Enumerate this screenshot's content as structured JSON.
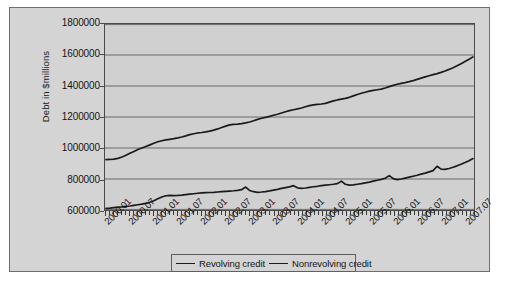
{
  "chart_data": {
    "type": "line",
    "title": "",
    "xlabel": "",
    "ylabel": "Debt in $millions",
    "ylim": [
      600000,
      1800000
    ],
    "ytick_step": 200000,
    "ytick_labels": [
      "1800000",
      "1600000",
      "1400000",
      "1200000",
      "1000000",
      "800000",
      "600000"
    ],
    "ytick_values": [
      1800000,
      1600000,
      1400000,
      1200000,
      1000000,
      800000,
      600000
    ],
    "grid": "horizontal",
    "legend_position": "bottom",
    "x_tick_labels": [
      "2000.01",
      "2000.07",
      "2001.01",
      "2001.07",
      "2002.01",
      "2002.07",
      "2003.01",
      "2003.07",
      "2004.01",
      "2004.07",
      "2005.01",
      "2005.07",
      "2006.01",
      "2006.07",
      "2007.01",
      "2007.07"
    ],
    "x_minor_tick_interval_months": 1,
    "x_range": [
      "2000.01",
      "2007.09"
    ],
    "x_months": [
      "2000.01",
      "2000.02",
      "2000.03",
      "2000.04",
      "2000.05",
      "2000.06",
      "2000.07",
      "2000.08",
      "2000.09",
      "2000.10",
      "2000.11",
      "2000.12",
      "2001.01",
      "2001.02",
      "2001.03",
      "2001.04",
      "2001.05",
      "2001.06",
      "2001.07",
      "2001.08",
      "2001.09",
      "2001.10",
      "2001.11",
      "2001.12",
      "2002.01",
      "2002.02",
      "2002.03",
      "2002.04",
      "2002.05",
      "2002.06",
      "2002.07",
      "2002.08",
      "2002.09",
      "2002.10",
      "2002.11",
      "2002.12",
      "2003.01",
      "2003.02",
      "2003.03",
      "2003.04",
      "2003.05",
      "2003.06",
      "2003.07",
      "2003.08",
      "2003.09",
      "2003.10",
      "2003.11",
      "2003.12",
      "2004.01",
      "2004.02",
      "2004.03",
      "2004.04",
      "2004.05",
      "2004.06",
      "2004.07",
      "2004.08",
      "2004.09",
      "2004.10",
      "2004.11",
      "2004.12",
      "2005.01",
      "2005.02",
      "2005.03",
      "2005.04",
      "2005.05",
      "2005.06",
      "2005.07",
      "2005.08",
      "2005.09",
      "2005.10",
      "2005.11",
      "2005.12",
      "2006.01",
      "2006.02",
      "2006.03",
      "2006.04",
      "2006.05",
      "2006.06",
      "2006.07",
      "2006.08",
      "2006.09",
      "2006.10",
      "2006.11",
      "2006.12",
      "2007.01",
      "2007.02",
      "2007.03",
      "2007.04",
      "2007.05",
      "2007.06",
      "2007.07",
      "2007.08",
      "2007.09"
    ],
    "series": [
      {
        "name": "Revolving credit",
        "color": "#1a1a1a",
        "values": [
          610000,
          612000,
          615000,
          618000,
          620000,
          623000,
          626000,
          630000,
          634000,
          638000,
          643000,
          650000,
          660000,
          672000,
          684000,
          692000,
          694000,
          693000,
          694000,
          696000,
          699000,
          702000,
          705000,
          708000,
          710000,
          712000,
          713000,
          714000,
          716000,
          718000,
          720000,
          722000,
          724000,
          727000,
          731000,
          748000,
          726000,
          718000,
          714000,
          716000,
          719000,
          723000,
          728000,
          733000,
          739000,
          744000,
          749000,
          757000,
          743000,
          740000,
          742000,
          746000,
          750000,
          753000,
          757000,
          760000,
          763000,
          766000,
          770000,
          786000,
          766000,
          760000,
          762000,
          766000,
          770000,
          775000,
          780000,
          786000,
          792000,
          798000,
          805000,
          822000,
          802000,
          796000,
          800000,
          806000,
          812000,
          818000,
          824000,
          831000,
          838000,
          846000,
          854000,
          882000,
          864000,
          862000,
          868000,
          876000,
          885000,
          895000,
          906000,
          918000,
          932000
        ]
      },
      {
        "name": "Nonrevolving credit",
        "color": "#1a1a1a",
        "values": [
          925000,
          926000,
          928000,
          933000,
          942000,
          953000,
          966000,
          978000,
          990000,
          1000000,
          1010000,
          1020000,
          1031000,
          1040000,
          1047000,
          1052000,
          1056000,
          1060000,
          1065000,
          1071000,
          1078000,
          1086000,
          1092000,
          1097000,
          1100000,
          1104000,
          1109000,
          1115000,
          1123000,
          1132000,
          1141000,
          1149000,
          1152000,
          1154000,
          1157000,
          1162000,
          1168000,
          1176000,
          1185000,
          1192000,
          1198000,
          1204000,
          1211000,
          1218000,
          1226000,
          1234000,
          1241000,
          1247000,
          1252000,
          1258000,
          1266000,
          1273000,
          1278000,
          1281000,
          1284000,
          1288000,
          1296000,
          1304000,
          1310000,
          1315000,
          1320000,
          1327000,
          1336000,
          1345000,
          1353000,
          1360000,
          1367000,
          1372000,
          1376000,
          1380000,
          1387000,
          1396000,
          1404000,
          1411000,
          1417000,
          1422000,
          1428000,
          1435000,
          1443000,
          1451000,
          1459000,
          1466000,
          1473000,
          1480000,
          1488000,
          1497000,
          1507000,
          1518000,
          1530000,
          1544000,
          1558000,
          1572000,
          1588000
        ]
      }
    ]
  },
  "legend": {
    "items": [
      {
        "label": "Revolving credit"
      },
      {
        "label": "Nonrevolving credit"
      }
    ]
  },
  "axes": {
    "y_title": "Debt in $millions"
  },
  "colors": {
    "chart_background": "#d4d4d4",
    "plot_background": "#d0d0d0",
    "gridline": "#6a6a6a",
    "line": "#1a1a1a",
    "border": "#4a4a4a",
    "text": "#141414"
  },
  "scan": {
    "top_artifact": "· · · · · · · ·"
  }
}
